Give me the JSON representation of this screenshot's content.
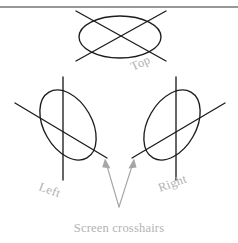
{
  "figure": {
    "background_color": "#ffffff",
    "line_color": "#1c1c1c",
    "label_color": "#b0b0b0",
    "caption_color": "#b3b3b3",
    "arrow_color": "#a6a6a6",
    "rule_color": "#303030",
    "caption": "Screen crosshairs",
    "views": [
      {
        "id": "top",
        "label": "Top",
        "label_rotation": -25,
        "ellipse": {
          "cx": 120,
          "cy": 37,
          "rx": 41,
          "ry": 21,
          "rotation": 0
        },
        "crosshair_type": "diagonal-x",
        "lines": [
          {
            "x1": 76,
            "y1": 11,
            "x2": 166,
            "y2": 61
          },
          {
            "x1": 166,
            "y1": 11,
            "x2": 76,
            "y2": 61
          }
        ],
        "label_pos": {
          "x": 133,
          "y": 71
        }
      },
      {
        "id": "left",
        "label": "Left",
        "label_rotation": 20,
        "ellipse": {
          "cx": 68,
          "cy": 125,
          "rx": 24,
          "ry": 38,
          "rotation": -30
        },
        "crosshair_type": "vertical-plus-diagonal",
        "lines": [
          {
            "x1": 63,
            "y1": 77,
            "x2": 63,
            "y2": 180
          },
          {
            "x1": 15,
            "y1": 103,
            "x2": 107,
            "y2": 158
          }
        ],
        "label_pos": {
          "x": 38,
          "y": 190
        }
      },
      {
        "id": "right",
        "label": "Right",
        "label_rotation": -20,
        "ellipse": {
          "cx": 172,
          "cy": 125,
          "rx": 24,
          "ry": 38,
          "rotation": 30
        },
        "crosshair_type": "vertical-plus-diagonal",
        "lines": [
          {
            "x1": 176,
            "y1": 77,
            "x2": 176,
            "y2": 180
          },
          {
            "x1": 225,
            "y1": 103,
            "x2": 132,
            "y2": 158
          }
        ],
        "label_pos": {
          "x": 160,
          "y": 192
        }
      }
    ],
    "annotation_arrows": [
      {
        "id": "arrow-to-left-crosshair",
        "from_x": 119,
        "from_y": 207,
        "to_x": 105,
        "to_y": 159
      },
      {
        "id": "arrow-to-right-crosshair",
        "from_x": 119,
        "from_y": 207,
        "to_x": 134,
        "to_y": 159
      }
    ],
    "caption_pos": {
      "x": 119,
      "y": 232
    },
    "top_rule": {
      "x1": 0,
      "y1": 7,
      "x2": 238,
      "y2": 7
    }
  }
}
